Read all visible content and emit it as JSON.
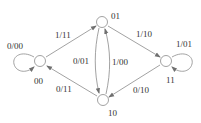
{
  "diagram": {
    "type": "state-transition",
    "colors": {
      "stroke": "#8a8a8a",
      "text": "#333333",
      "background": "#ffffff"
    },
    "states": [
      {
        "id": "00",
        "label": "00",
        "x": 40,
        "y": 61
      },
      {
        "id": "01",
        "label": "01",
        "x": 102,
        "y": 22
      },
      {
        "id": "10",
        "label": "10",
        "x": 103,
        "y": 100
      },
      {
        "id": "11",
        "label": "11",
        "x": 166,
        "y": 61
      }
    ],
    "transitions": [
      {
        "from": "00",
        "to": "00",
        "label": "0/00"
      },
      {
        "from": "00",
        "to": "01",
        "label": "1/11"
      },
      {
        "from": "01",
        "to": "10",
        "label": "0/01"
      },
      {
        "from": "10",
        "to": "01",
        "label": "1/00"
      },
      {
        "from": "01",
        "to": "11",
        "label": "1/10"
      },
      {
        "from": "11",
        "to": "11",
        "label": "1/01"
      },
      {
        "from": "11",
        "to": "10",
        "label": "0/10"
      },
      {
        "from": "10",
        "to": "00",
        "label": "0/11"
      }
    ]
  }
}
